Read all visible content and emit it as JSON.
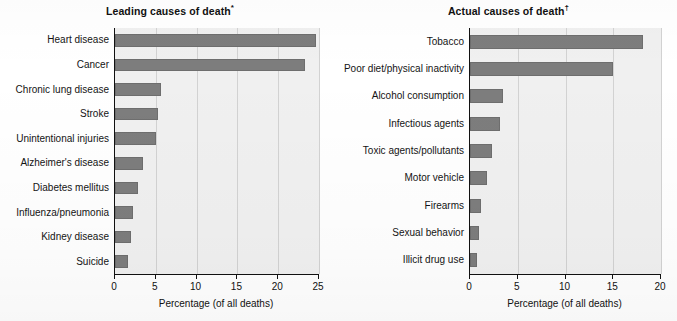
{
  "figure": {
    "background": "#ffffff",
    "bar_color": "#7d7d7d",
    "plot_background": "#f0f0f0",
    "grid_color": "#d2d2d2",
    "axis_color": "#111111"
  },
  "chart_data": [
    {
      "type": "bar",
      "orientation": "horizontal",
      "title": "Leading causes of death",
      "title_marker": "*",
      "xlabel": "Percentage (of all deaths)",
      "ylabel": "",
      "xlim": [
        0,
        25
      ],
      "xticks": [
        0,
        5,
        10,
        15,
        20,
        25
      ],
      "xtick_labels": [
        "0",
        "5",
        "10",
        "15",
        "20",
        "25"
      ],
      "grid": true,
      "legend": "none",
      "categories": [
        "Heart disease",
        "Cancer",
        "Chronic lung disease",
        "Stroke",
        "Unintentional injuries",
        "Alzheimer's disease",
        "Diabetes mellitus",
        "Influenza/pneumonia",
        "Kidney disease",
        "Suicide"
      ],
      "values": [
        24.6,
        23.3,
        5.6,
        5.3,
        5.0,
        3.4,
        2.8,
        2.2,
        2.0,
        1.6
      ]
    },
    {
      "type": "bar",
      "orientation": "horizontal",
      "title": "Actual causes of death",
      "title_marker": "†",
      "xlabel": "Percentage (of all deaths)",
      "ylabel": "",
      "xlim": [
        0,
        20
      ],
      "xticks": [
        0,
        5,
        10,
        15,
        20
      ],
      "xtick_labels": [
        "0",
        "5",
        "10",
        "15",
        "20"
      ],
      "grid": true,
      "legend": "none",
      "categories": [
        "Tobacco",
        "Poor diet/physical inactivity",
        "Alcohol consumption",
        "Infectious agents",
        "Toxic agents/pollutants",
        "Motor vehicle",
        "Firearms",
        "Sexual behavior",
        "Illicit drug use"
      ],
      "values": [
        18.1,
        15.0,
        3.5,
        3.1,
        2.3,
        1.8,
        1.2,
        0.9,
        0.7
      ]
    }
  ]
}
